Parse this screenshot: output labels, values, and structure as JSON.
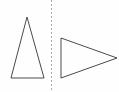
{
  "figure": {
    "canvas": {
      "width": 119,
      "height": 92,
      "background_color": "#fefefe"
    },
    "stroke_color": "#4a4a4a",
    "stroke_width": 1,
    "axis": {
      "name": "mirror-line",
      "orientation": "vertical",
      "style": "dashed",
      "color": "#b0a9ad",
      "dash_pattern": "2 2",
      "x": 51.5,
      "y_start": 0,
      "y_end": 92
    },
    "shapes": [
      {
        "name": "left-triangle",
        "type": "triangle",
        "orientation": "pointing-up",
        "fill": "none",
        "points": "27,17 44,78 11,78",
        "vertices": [
          {
            "label": "apex",
            "x": 27,
            "y": 17
          },
          {
            "label": "bottom-right",
            "x": 44,
            "y": 78
          },
          {
            "label": "bottom-left",
            "x": 11,
            "y": 78
          }
        ]
      },
      {
        "name": "right-triangle",
        "type": "triangle",
        "orientation": "pointing-right",
        "fill": "none",
        "points": "61,38 117,58 61,78",
        "vertices": [
          {
            "label": "top-left",
            "x": 61,
            "y": 38
          },
          {
            "label": "right-apex",
            "x": 117,
            "y": 58
          },
          {
            "label": "bottom-left",
            "x": 61,
            "y": 78
          }
        ]
      }
    ]
  }
}
